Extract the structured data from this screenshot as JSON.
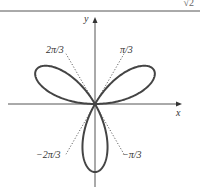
{
  "header": {
    "fragment_text": "√2"
  },
  "diagram": {
    "axes": {
      "x_label": "x",
      "y_label": "y",
      "origin_px": [
        95,
        104
      ],
      "x_range_px": [
        8,
        182
      ],
      "y_range_px": [
        17,
        187
      ]
    },
    "curve": {
      "equation": "r = sin 3θ",
      "type": "polar rose",
      "petals": 3,
      "scale_px": 68,
      "color": "#444444",
      "stroke_width": 2
    },
    "rays": [
      {
        "label": "π/3",
        "angle_deg": 60
      },
      {
        "label": "2π/3",
        "angle_deg": 120
      },
      {
        "label": "−π/3",
        "angle_deg": -60
      },
      {
        "label": "−2π/3",
        "angle_deg": -120
      }
    ],
    "ray_labels": {
      "pi_3": "π/3",
      "two_pi_3": "2π/3",
      "neg_pi_3": "−π/3",
      "neg_two_pi_3": "−2π/3"
    }
  }
}
